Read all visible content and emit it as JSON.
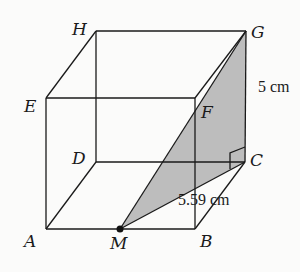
{
  "diagram": {
    "type": "cube-3d-geometry",
    "vertices": {
      "A": {
        "label": "A",
        "x": 46,
        "y": 229
      },
      "B": {
        "label": "B",
        "x": 195,
        "y": 229
      },
      "C": {
        "label": "C",
        "x": 245,
        "y": 162
      },
      "D": {
        "label": "D",
        "x": 96,
        "y": 162
      },
      "E": {
        "label": "E",
        "x": 46,
        "y": 98
      },
      "F": {
        "label": "F",
        "x": 195,
        "y": 98
      },
      "G": {
        "label": "G",
        "x": 246,
        "y": 31
      },
      "H": {
        "label": "H",
        "x": 96,
        "y": 31
      },
      "M": {
        "label": "M",
        "x": 120,
        "y": 229
      }
    },
    "measurements": {
      "cg_length": "5 cm",
      "mc_length": "5.59 cm"
    },
    "shaded_triangle": [
      "M",
      "C",
      "G"
    ],
    "colors": {
      "line": "#1a1a1a",
      "shade": "#b9b9b9",
      "background": "#fbfbfa"
    }
  }
}
